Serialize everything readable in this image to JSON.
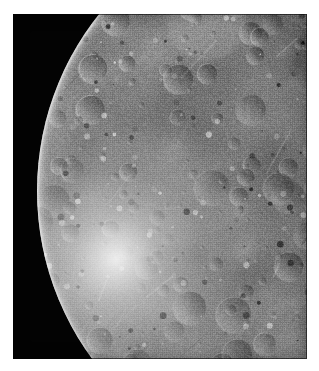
{
  "image": {
    "kind": "spacecraft-photograph",
    "subject": "icy satellite",
    "description": "Grayscale spacecraft photograph showing the sunlit north-west limb of a heavily cratered icy moon against black space. The bright smooth limb runs from the upper-middle of the frame down to the lower-left; terrain grows darker and more shadowed toward the terminator at the right edge.",
    "alt_text": "Cratered icy moon limb against black space",
    "caption": "",
    "overlay_text": [],
    "width_px": 319,
    "height_px": 371
  },
  "frame": {
    "paper_color": "#ffffff",
    "margin_left_px": 13,
    "margin_top_px": 14,
    "plate_width_px": 294,
    "plate_height_px": 345
  },
  "colors": {
    "space_black": "#030303",
    "terrain_mid_gray": "#8e8e8e",
    "limb_highlight": "#f2f2f2",
    "shadow_dark": "#1d1d1d",
    "paper_white": "#ffffff"
  },
  "scene": {
    "limb_side": "left",
    "terminator_side": "right",
    "sun_direction": "from lower-left",
    "disc_center_x_px": 321,
    "disc_center_y_px": 191,
    "disc_radius_px": 283,
    "surface_texture": "densely cratered, saturated impact terrain"
  },
  "terrain": {
    "crater_count": 520,
    "brightness_min": 0.1,
    "brightness_max": 0.97,
    "grain_opacity": 0.42
  }
}
